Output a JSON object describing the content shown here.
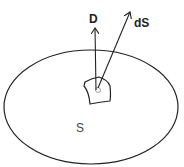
{
  "diagram": {
    "labels": {
      "vector_d": "D",
      "vector_ds": "dS",
      "surface": "S"
    },
    "colors": {
      "stroke": "#222222",
      "background": "#ffffff"
    }
  }
}
